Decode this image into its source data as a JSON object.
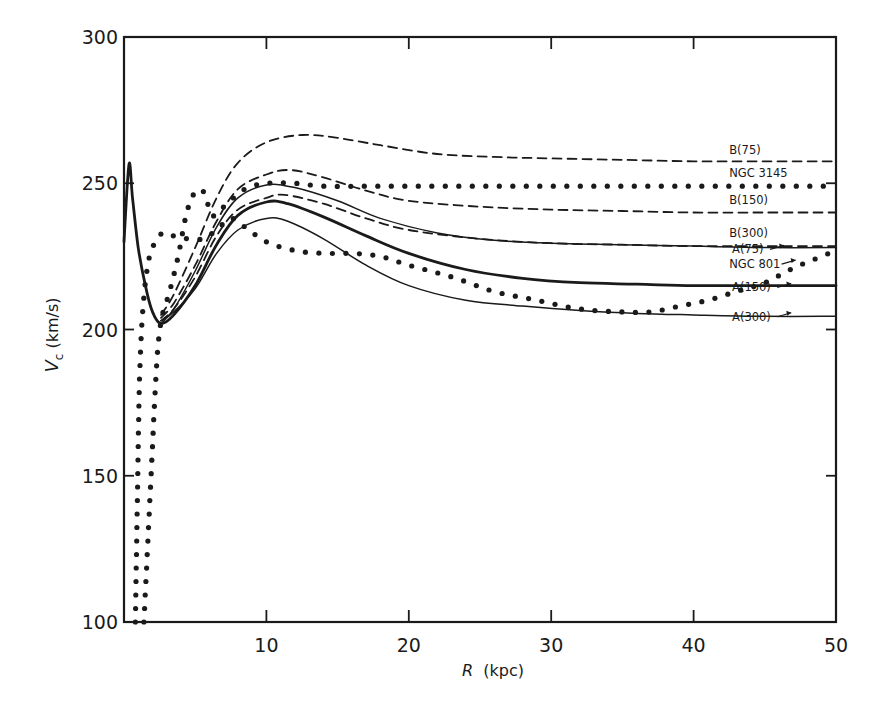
{
  "chart_data": {
    "type": "line",
    "title": "",
    "xlabel": "R (kpc)",
    "xlabel_italic_part": "R",
    "xlabel_unit": "(kpc)",
    "ylabel": "V_c (km/s)",
    "ylabel_main": "V",
    "ylabel_sub": "c",
    "ylabel_unit": "(km/s)",
    "xlim": [
      0,
      50
    ],
    "ylim": [
      100,
      300
    ],
    "x_ticks": [
      10,
      20,
      30,
      40,
      50
    ],
    "y_ticks": [
      100,
      150,
      200,
      250,
      300
    ],
    "grid": false,
    "legend_position": "inline labels at right edge",
    "series": [
      {
        "name": "B(75)",
        "style": "dashed",
        "points": [
          [
            2.6,
            205
          ],
          [
            3.5,
            212
          ],
          [
            5,
            228
          ],
          [
            6.5,
            245
          ],
          [
            8,
            257
          ],
          [
            10,
            264
          ],
          [
            12.5,
            266.5
          ],
          [
            15,
            265.5
          ],
          [
            18,
            263
          ],
          [
            22,
            260
          ],
          [
            26,
            259
          ],
          [
            30,
            258.5
          ],
          [
            35,
            258
          ],
          [
            40,
            257.5
          ],
          [
            45,
            257.5
          ],
          [
            50,
            257.5
          ]
        ]
      },
      {
        "name": "NGC 3145",
        "style": "dotted",
        "points": [
          [
            1.4,
            100
          ],
          [
            1.6,
            120
          ],
          [
            1.8,
            140
          ],
          [
            2,
            160
          ],
          [
            2.2,
            180
          ],
          [
            2.4,
            195
          ],
          [
            2.7,
            205
          ],
          [
            3.2,
            213
          ],
          [
            3.8,
            225
          ],
          [
            4.4,
            240
          ],
          [
            5,
            247
          ],
          [
            5.6,
            247
          ],
          [
            6.2,
            239
          ],
          [
            7,
            242
          ],
          [
            8.5,
            248
          ],
          [
            10,
            250
          ],
          [
            12,
            250
          ],
          [
            14,
            249
          ],
          [
            17,
            249
          ],
          [
            20,
            249
          ],
          [
            25,
            249
          ],
          [
            30,
            249
          ],
          [
            35,
            249
          ],
          [
            40,
            249
          ],
          [
            45,
            249
          ],
          [
            50,
            249
          ]
        ]
      },
      {
        "name": "B(150)",
        "style": "dashed",
        "points": [
          [
            2.6,
            204
          ],
          [
            3.5,
            209
          ],
          [
            5,
            222
          ],
          [
            6.5,
            237
          ],
          [
            8,
            248
          ],
          [
            10,
            253
          ],
          [
            11.7,
            254.5
          ],
          [
            14,
            252
          ],
          [
            17,
            247.5
          ],
          [
            20,
            244
          ],
          [
            25,
            242
          ],
          [
            30,
            241
          ],
          [
            35,
            240.5
          ],
          [
            40,
            240
          ],
          [
            45,
            240
          ],
          [
            50,
            240
          ]
        ]
      },
      {
        "name": "A(75)",
        "style": "solid",
        "points": [
          [
            2.6,
            202
          ],
          [
            3.5,
            207
          ],
          [
            5,
            220
          ],
          [
            6.5,
            235
          ],
          [
            8,
            245
          ],
          [
            10,
            249.4
          ],
          [
            12,
            248.5
          ],
          [
            15,
            244
          ],
          [
            18,
            238
          ],
          [
            22,
            233
          ],
          [
            26,
            230.5
          ],
          [
            30,
            229.5
          ],
          [
            35,
            229
          ],
          [
            40,
            228.5
          ],
          [
            45,
            228
          ],
          [
            50,
            228
          ]
        ]
      },
      {
        "name": "B(300)",
        "style": "dashed",
        "points": [
          [
            2.6,
            203
          ],
          [
            3.5,
            207
          ],
          [
            5,
            218
          ],
          [
            6.5,
            232
          ],
          [
            8,
            241
          ],
          [
            10,
            245
          ],
          [
            11.3,
            246
          ],
          [
            14,
            243
          ],
          [
            17,
            238
          ],
          [
            20,
            234
          ],
          [
            25,
            231
          ],
          [
            30,
            229.5
          ],
          [
            35,
            229
          ],
          [
            40,
            228.5
          ],
          [
            45,
            228.5
          ],
          [
            50,
            228.5
          ]
        ]
      },
      {
        "name": "NGC 801",
        "style": "dotted",
        "points": [
          [
            0.8,
            100
          ],
          [
            0.9,
            130
          ],
          [
            1,
            160
          ],
          [
            1.1,
            185
          ],
          [
            1.3,
            205
          ],
          [
            1.6,
            220
          ],
          [
            2,
            228
          ],
          [
            2.7,
            233
          ],
          [
            3.5,
            232
          ],
          [
            4.5,
            231
          ],
          [
            5.5,
            231
          ],
          [
            6.5,
            234
          ],
          [
            7.5,
            238
          ],
          [
            8.5,
            235
          ],
          [
            10,
            230
          ],
          [
            12,
            227
          ],
          [
            14,
            226
          ],
          [
            16,
            226
          ],
          [
            18,
            225
          ],
          [
            20,
            222
          ],
          [
            23,
            218
          ],
          [
            26,
            213
          ],
          [
            29,
            210
          ],
          [
            32,
            207
          ],
          [
            35,
            206
          ],
          [
            37,
            206
          ],
          [
            39,
            208
          ],
          [
            41,
            210
          ],
          [
            43,
            213
          ],
          [
            45,
            216
          ],
          [
            47,
            221
          ],
          [
            49,
            225
          ],
          [
            50,
            227
          ]
        ]
      },
      {
        "name": "A(150)",
        "style": "solid-thick",
        "points": [
          [
            0,
            230
          ],
          [
            0.35,
            256.5
          ],
          [
            0.6,
            245
          ],
          [
            1,
            228
          ],
          [
            1.5,
            215
          ],
          [
            2,
            206
          ],
          [
            2.6,
            202
          ],
          [
            3.5,
            205
          ],
          [
            5,
            215
          ],
          [
            6.5,
            229
          ],
          [
            8,
            239
          ],
          [
            10,
            243.6
          ],
          [
            11.5,
            243
          ],
          [
            14,
            238.5
          ],
          [
            17,
            232
          ],
          [
            20,
            226
          ],
          [
            24,
            220.5
          ],
          [
            28,
            217.5
          ],
          [
            32,
            216
          ],
          [
            36,
            215.5
          ],
          [
            40,
            215
          ],
          [
            45,
            215
          ],
          [
            50,
            215
          ]
        ]
      },
      {
        "name": "A(300)",
        "style": "solid",
        "points": [
          [
            2.6,
            203
          ],
          [
            3.5,
            206
          ],
          [
            5,
            214
          ],
          [
            6.5,
            226
          ],
          [
            8,
            234
          ],
          [
            10,
            238
          ],
          [
            11.5,
            237
          ],
          [
            14,
            231
          ],
          [
            17,
            222
          ],
          [
            20,
            215
          ],
          [
            24,
            210
          ],
          [
            28,
            208
          ],
          [
            32,
            206.5
          ],
          [
            36,
            205.5
          ],
          [
            40,
            205
          ],
          [
            45,
            204.5
          ],
          [
            50,
            204.5
          ]
        ]
      }
    ],
    "annotations": [
      {
        "text": "B(75)",
        "x": 42.5,
        "y": 260,
        "arrow": false
      },
      {
        "text": "NGC 3145",
        "x": 42.5,
        "y": 252,
        "arrow": false
      },
      {
        "text": "B(150)",
        "x": 42.5,
        "y": 243,
        "arrow": false
      },
      {
        "text": "B(300)",
        "x": 42.5,
        "y": 231.5,
        "arrow": false
      },
      {
        "text": "A(75)",
        "x": 42.7,
        "y": 226,
        "arrow": true
      },
      {
        "text": "NGC 801",
        "x": 42.5,
        "y": 221,
        "arrow": true
      },
      {
        "text": "A(150)",
        "x": 42.7,
        "y": 213,
        "arrow": true
      },
      {
        "text": "A(300)",
        "x": 42.7,
        "y": 203,
        "arrow": true
      }
    ]
  }
}
